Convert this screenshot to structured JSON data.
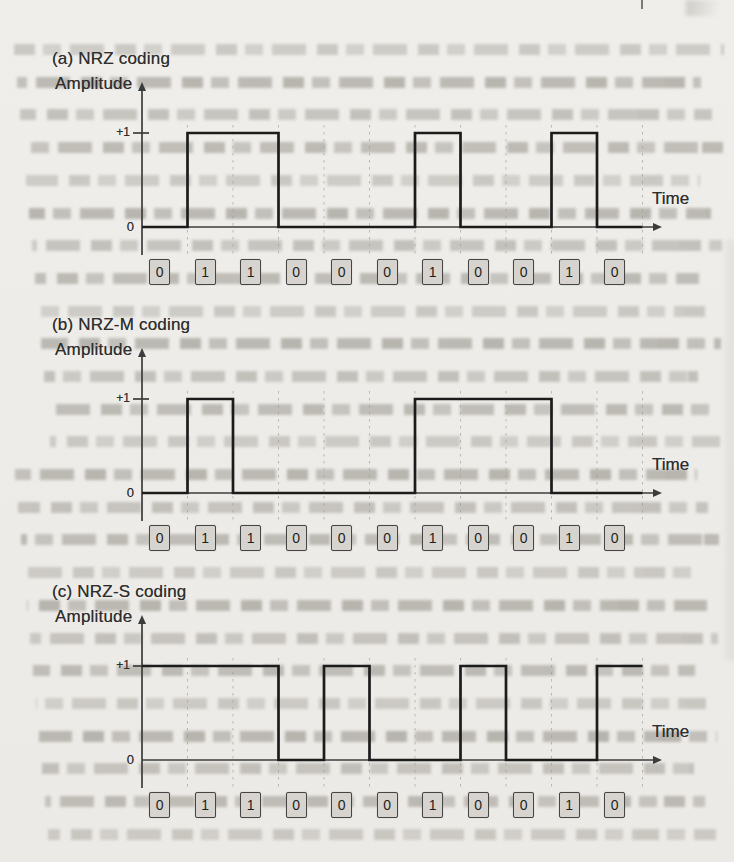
{
  "figure": {
    "kind": "scanned-book-figure",
    "description_visible_charts": 3
  },
  "colors": {
    "paper": "#edece8",
    "ink": "#2e2e2e",
    "waveform": "#1c1c1c",
    "axis": "#3c3c3c",
    "grid_dash": "#9b9b97",
    "bit_box_fill": "#d7d4cf",
    "bit_box_border": "#454545",
    "bleed_text": "#655f56"
  },
  "chart_data": [
    {
      "type": "line",
      "subtype": "digital-step-waveform",
      "title": "(a) NRZ coding",
      "ylabel": "Amplitude",
      "xlabel": "Time",
      "ytick_labels": [
        "0",
        "+1"
      ],
      "ylim": [
        0,
        1
      ],
      "grid": "vertical-dashed-per-bit",
      "bits": [
        0,
        1,
        1,
        0,
        0,
        0,
        1,
        0,
        0,
        1,
        0
      ],
      "levels_per_bit": [
        0,
        1,
        1,
        0,
        0,
        0,
        1,
        0,
        0,
        1,
        0
      ]
    },
    {
      "type": "line",
      "subtype": "digital-step-waveform",
      "title": "(b) NRZ-M coding",
      "ylabel": "Amplitude",
      "xlabel": "Time",
      "ytick_labels": [
        "0",
        "+1"
      ],
      "ylim": [
        0,
        1
      ],
      "grid": "vertical-dashed-per-bit",
      "bits": [
        0,
        1,
        1,
        0,
        0,
        0,
        1,
        0,
        0,
        1,
        0
      ],
      "levels_per_bit": [
        0,
        1,
        0,
        0,
        0,
        0,
        1,
        1,
        1,
        0,
        0
      ]
    },
    {
      "type": "line",
      "subtype": "digital-step-waveform",
      "title": "(c) NRZ-S coding",
      "ylabel": "Amplitude",
      "xlabel": "Time",
      "ytick_labels": [
        "0",
        "+1"
      ],
      "ylim": [
        0,
        1
      ],
      "grid": "vertical-dashed-per-bit",
      "bits": [
        0,
        1,
        1,
        0,
        0,
        0,
        1,
        0,
        0,
        1,
        0
      ],
      "levels_per_bit": [
        1,
        1,
        1,
        0,
        1,
        0,
        0,
        1,
        0,
        0,
        1
      ]
    }
  ]
}
